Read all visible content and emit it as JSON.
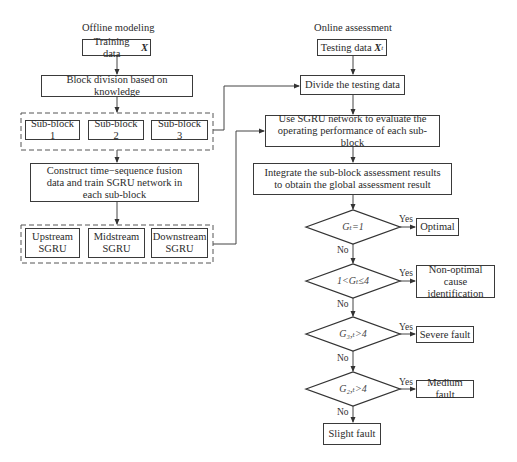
{
  "diagram": {
    "offline": {
      "title": "Offline modeling",
      "training_data": "Training data",
      "training_var": "X",
      "block_division": "Block division based on knowledge",
      "sub_blocks": [
        "Sub-block 1",
        "Sub-block 2",
        "Sub-block 3"
      ],
      "construct": "Construct time−sequence fusion data and train SGRU network in each sub-block",
      "sgru_models": [
        {
          "line1": "Upstream",
          "line2": "SGRU"
        },
        {
          "line1": "Midstream",
          "line2": "SGRU"
        },
        {
          "line1": "Downstream",
          "line2": "SGRU"
        }
      ]
    },
    "online": {
      "title": "Online assessment",
      "testing_data": "Testing data",
      "testing_var": "X",
      "testing_sub": "t",
      "divide": "Divide the testing data",
      "use_sgru": "Use SGRU network to evaluate the operating performance of each sub-block",
      "integrate": "Integrate the sub-block assessment results to obtain the global assessment result",
      "decisions": [
        {
          "condition": "Gₜ=1",
          "yes_label": "Yes",
          "no_label": "No",
          "outcome": "Optimal"
        },
        {
          "condition": "1<Gₜ≤4",
          "yes_label": "Yes",
          "no_label": "No",
          "outcome": "Non-optimal cause identification"
        },
        {
          "condition": "G₃,ₜ>4",
          "yes_label": "Yes",
          "no_label": "No",
          "outcome": "Severe fault"
        },
        {
          "condition": "G₂,ₜ>4",
          "yes_label": "Yes",
          "no_label": "No",
          "outcome": "Medium fault"
        }
      ],
      "final_outcome": "Slight fault"
    }
  }
}
